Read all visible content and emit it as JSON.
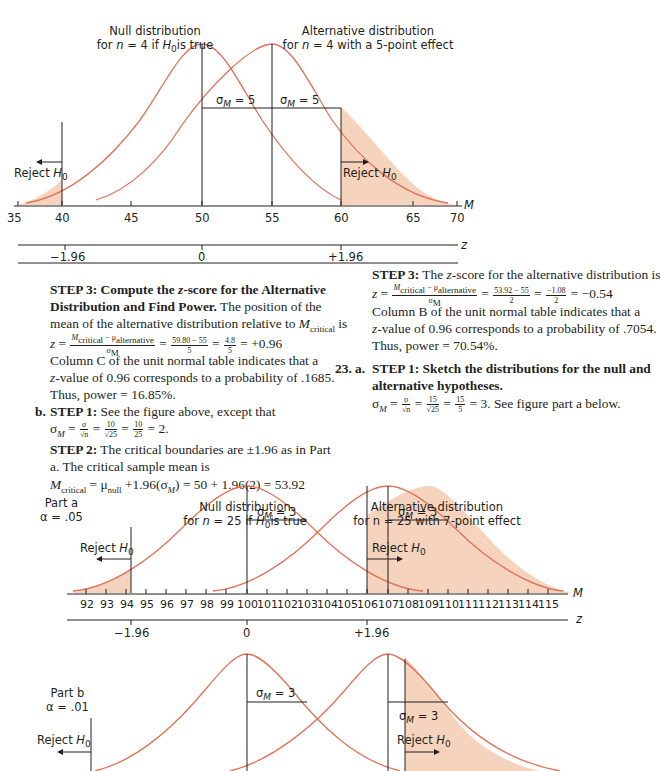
{
  "colors": {
    "curve": "#e0735a",
    "shade": "#f6d3bc",
    "line": "#231f20",
    "text": "#231f20"
  },
  "figure1": {
    "null_label_1": "Null distribution",
    "null_label_2": "for n = 4 if H0 is true",
    "alt_label_1": "Alternative distribution",
    "alt_label_2": "for n = 4 with a 5-point effect",
    "sigma_left": "σM = 5",
    "sigma_right": "σM = 5",
    "reject_left": "Reject H0",
    "reject_right": "Reject H0",
    "m_axis_label": "M",
    "z_axis_label": "z",
    "m_ticks": [
      "35",
      "40",
      "45",
      "50",
      "55",
      "60",
      "65",
      "70"
    ],
    "z_ticks": [
      "−1.96",
      "0",
      "+1.96"
    ]
  },
  "left_col": {
    "step3_heading": "STEP 3: Compute the z-score for the Alternative",
    "step3_heading2": "Distribution and Find Power.",
    "step3_text1": " The position of the",
    "step3_text2": "mean of the alternative distribution relative to M",
    "step3_text2_sub": "critical",
    "step3_text2_end": " is",
    "eq1_lhs": "z =",
    "eq1_num": "Mcritical − μalternative",
    "eq1_den": "σM",
    "eq1_num2": "59.80 − 55",
    "eq1_den2": "5",
    "eq1_num3": "4.8",
    "eq1_den3": "5",
    "eq1_result": "= +0.96",
    "line_col_c": "Column C of the unit normal table indicates that a",
    "line_zval": "z-value of 0.96 corresponds to a probability of .1685.",
    "line_power": "Thus, power = 16.85%.",
    "b_label": "b.",
    "b_step1": "STEP 1:",
    "b_step1_text": " See the figure above, except that",
    "b_sigma_eq": "σM =",
    "b_sigma_num1": "σ",
    "b_sigma_den1": "√n",
    "b_sigma_num2": "10",
    "b_sigma_den2": "√25",
    "b_sigma_num3": "10",
    "b_sigma_den3": "25",
    "b_sigma_result": "= 2.",
    "b_step2": "STEP 2:",
    "b_step2_text": " The critical boundaries are ±1.96 as in Part",
    "b_step2_text2": "a. The critical sample mean is",
    "b_mcrit": "Mcritical = μnull +1.96(σM) = 50 + 1.96(2) = 53.92"
  },
  "right_col": {
    "step3": "STEP 3:",
    "step3_text": " The z-score for the alternative distribution is",
    "eq_lhs": "z =",
    "eq_num": "Mcritical − μalternative",
    "eq_den": "σM",
    "eq_num2": "53.92 − 55",
    "eq_den2": "2",
    "eq_num3": "−1.08",
    "eq_den3": "2",
    "eq_result": "= −0.54",
    "line_col_b": "Column B of the unit normal table indicates that a",
    "line_zval": "z-value of 0.96 corresponds to a probability of .7054.",
    "line_power": "Thus, power = 70.54%.",
    "q_number": "23.",
    "q_part": "a.",
    "q_step1": "STEP 1: Sketch the distributions for the null and",
    "q_step1_2": "alternative hypotheses.",
    "q_sigma_eq": "σM =",
    "q_num1": "σ",
    "q_den1": "√n",
    "q_num2": "15",
    "q_den2": "√25",
    "q_num3": "15",
    "q_den3": "5",
    "q_result": "= 3. See figure part a below."
  },
  "figure2": {
    "null_label_1": "Null distribution",
    "null_label_2": "for n = 25 if H0 is true",
    "alt_label_1": "Alternative distribution",
    "alt_label_2": "for n = 25 with 7-point effect",
    "part_label": "Part a",
    "alpha_label": "α = .05",
    "sigma_left": "σM = 3",
    "sigma_right": "σM = 3",
    "reject_left": "Reject H0",
    "reject_right": "Reject H0",
    "m_axis_label": "M",
    "z_axis_label": "z",
    "m_ticks": [
      "92",
      "93",
      "94",
      "95",
      "96",
      "97",
      "98",
      "99",
      "100",
      "101",
      "102",
      "103",
      "104",
      "105",
      "106",
      "107",
      "108",
      "109",
      "110",
      "111",
      "112",
      "113",
      "114",
      "115"
    ],
    "z_ticks": [
      "−1.96",
      "0",
      "+1.96"
    ]
  },
  "figure3": {
    "part_label": "Part b",
    "alpha_label": "α = .01",
    "sigma_left": "σM = 3",
    "sigma_right": "σM = 3",
    "reject_left": "Reject H0",
    "reject_right": "Reject H0",
    "m_axis_label": "M"
  }
}
